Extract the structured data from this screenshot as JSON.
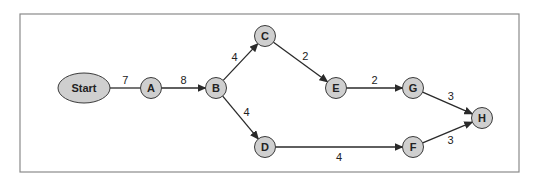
{
  "diagram": {
    "type": "network-flow",
    "frame": {
      "x": 20,
      "y": 14,
      "width": 499,
      "height": 158,
      "stroke": "#8a8a8a"
    },
    "colors": {
      "node_fill": "#cfcfcf",
      "node_stroke": "#3a3a3a",
      "edge": "#2a2a2a",
      "text": "#222222"
    },
    "nodes": [
      {
        "id": "Start",
        "label": "Start",
        "shape": "ellipse",
        "x": 84,
        "y": 88
      },
      {
        "id": "A",
        "label": "A",
        "shape": "circle",
        "x": 151,
        "y": 88
      },
      {
        "id": "B",
        "label": "B",
        "shape": "circle",
        "x": 216,
        "y": 88
      },
      {
        "id": "C",
        "label": "C",
        "shape": "circle",
        "x": 265,
        "y": 36
      },
      {
        "id": "D",
        "label": "D",
        "shape": "circle",
        "x": 265,
        "y": 147
      },
      {
        "id": "E",
        "label": "E",
        "shape": "circle",
        "x": 336,
        "y": 88
      },
      {
        "id": "G",
        "label": "G",
        "shape": "circle",
        "x": 413,
        "y": 88
      },
      {
        "id": "F",
        "label": "F",
        "shape": "circle",
        "x": 413,
        "y": 147
      },
      {
        "id": "H",
        "label": "H",
        "shape": "circle",
        "x": 482,
        "y": 118
      }
    ],
    "edges": [
      {
        "from": "Start",
        "to": "A",
        "weight": "7",
        "arrow": false
      },
      {
        "from": "A",
        "to": "B",
        "weight": "8",
        "arrow": true
      },
      {
        "from": "B",
        "to": "C",
        "weight": "4",
        "arrow": true
      },
      {
        "from": "B",
        "to": "D",
        "weight": "4",
        "arrow": true
      },
      {
        "from": "C",
        "to": "E",
        "weight": "2",
        "arrow": true
      },
      {
        "from": "E",
        "to": "G",
        "weight": "2",
        "arrow": true
      },
      {
        "from": "D",
        "to": "F",
        "weight": "4",
        "arrow": true
      },
      {
        "from": "G",
        "to": "H",
        "weight": "3",
        "arrow": true
      },
      {
        "from": "F",
        "to": "H",
        "weight": "3",
        "arrow": true
      }
    ]
  }
}
